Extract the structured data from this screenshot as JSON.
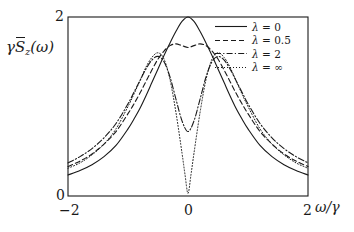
{
  "chart_data": {
    "type": "line",
    "title": "",
    "xlabel": "ω/γ",
    "ylabel": "γS̃_z(ω)",
    "xlim": [
      -2,
      2
    ],
    "ylim": [
      0,
      2
    ],
    "xticks": [
      "-2",
      "0",
      "2"
    ],
    "xtick_values": [
      -2,
      0,
      2
    ],
    "yticks": [
      "0",
      "2"
    ],
    "ytick_values": [
      0,
      2
    ],
    "grid": false,
    "legend_position": "top-right",
    "series": [
      {
        "name": "λ = 0",
        "linestyle": "solid",
        "color": "#1a1a1a",
        "peak_value": 2.0,
        "center_value": 2.0,
        "x": [
          -2,
          -1.8,
          -1.6,
          -1.4,
          -1.2,
          -1,
          -0.9,
          -0.8,
          -0.7,
          -0.6,
          -0.5,
          -0.4,
          -0.3,
          -0.2,
          -0.1,
          0,
          0.1,
          0.2,
          0.3,
          0.4,
          0.5,
          0.6,
          0.7,
          0.8,
          0.9,
          1,
          1.2,
          1.4,
          1.6,
          1.8,
          2
        ],
        "values": [
          0.235,
          0.285,
          0.35,
          0.44,
          0.565,
          0.75,
          0.86,
          0.98,
          1.12,
          1.27,
          1.42,
          1.57,
          1.71,
          1.84,
          1.95,
          2.0,
          1.95,
          1.84,
          1.71,
          1.57,
          1.42,
          1.27,
          1.12,
          0.98,
          0.86,
          0.75,
          0.565,
          0.44,
          0.35,
          0.285,
          0.235
        ]
      },
      {
        "name": "λ = 0.5",
        "linestyle": "dashed",
        "color": "#1a1a1a",
        "peak_value": 1.7,
        "center_value": 1.66,
        "x": [
          -2,
          -1.8,
          -1.6,
          -1.4,
          -1.2,
          -1,
          -0.9,
          -0.8,
          -0.7,
          -0.6,
          -0.5,
          -0.4,
          -0.3,
          -0.2,
          -0.1,
          0,
          0.1,
          0.2,
          0.3,
          0.4,
          0.5,
          0.6,
          0.7,
          0.8,
          0.9,
          1,
          1.2,
          1.4,
          1.6,
          1.8,
          2
        ],
        "values": [
          0.33,
          0.39,
          0.47,
          0.58,
          0.72,
          0.92,
          1.03,
          1.15,
          1.28,
          1.41,
          1.53,
          1.62,
          1.68,
          1.7,
          1.68,
          1.66,
          1.68,
          1.7,
          1.68,
          1.62,
          1.53,
          1.41,
          1.28,
          1.15,
          1.03,
          0.92,
          0.72,
          0.58,
          0.47,
          0.39,
          0.33
        ]
      },
      {
        "name": "λ = 2",
        "linestyle": "dashdot",
        "color": "#1a1a1a",
        "peak_value": 1.56,
        "center_value": 0.72,
        "x": [
          -2,
          -1.8,
          -1.6,
          -1.4,
          -1.2,
          -1,
          -0.9,
          -0.8,
          -0.7,
          -0.6,
          -0.5,
          -0.4,
          -0.3,
          -0.2,
          -0.1,
          0,
          0.1,
          0.2,
          0.3,
          0.4,
          0.5,
          0.6,
          0.7,
          0.8,
          0.9,
          1,
          1.2,
          1.4,
          1.6,
          1.8,
          2
        ],
        "values": [
          0.37,
          0.44,
          0.53,
          0.65,
          0.81,
          1.03,
          1.16,
          1.29,
          1.42,
          1.52,
          1.56,
          1.5,
          1.33,
          1.08,
          0.84,
          0.72,
          0.84,
          1.08,
          1.33,
          1.5,
          1.56,
          1.52,
          1.42,
          1.29,
          1.16,
          1.03,
          0.81,
          0.65,
          0.53,
          0.44,
          0.37
        ]
      },
      {
        "name": "λ = ∞",
        "linestyle": "dotted",
        "color": "#1a1a1a",
        "peak_value": 1.6,
        "center_value": 0.03,
        "x": [
          -2,
          -1.8,
          -1.6,
          -1.4,
          -1.2,
          -1,
          -0.9,
          -0.8,
          -0.7,
          -0.6,
          -0.5,
          -0.4,
          -0.3,
          -0.2,
          -0.1,
          -0.05,
          0,
          0.05,
          0.1,
          0.2,
          0.3,
          0.4,
          0.5,
          0.6,
          0.7,
          0.8,
          0.9,
          1,
          1.2,
          1.4,
          1.6,
          1.8,
          2
        ],
        "values": [
          0.31,
          0.37,
          0.46,
          0.58,
          0.75,
          1.0,
          1.14,
          1.29,
          1.44,
          1.55,
          1.6,
          1.53,
          1.3,
          0.93,
          0.48,
          0.24,
          0.03,
          0.24,
          0.48,
          0.93,
          1.3,
          1.53,
          1.6,
          1.55,
          1.44,
          1.29,
          1.14,
          1.0,
          0.75,
          0.58,
          0.46,
          0.37,
          0.31
        ]
      }
    ]
  },
  "axes": {
    "ylabel_gamma": "γ",
    "ylabel_s": "S",
    "ylabel_sub": "z",
    "ylabel_arg": "(ω)",
    "xlabel_text": "ω/γ",
    "ytick_top": "2",
    "ytick_bottom": "0",
    "xtick_left": "−2",
    "xtick_mid": "0",
    "xtick_right": "2"
  },
  "legend": {
    "entries": [
      {
        "label_lambda": "λ",
        "label_eq": "= 0",
        "style": "solid"
      },
      {
        "label_lambda": "λ",
        "label_eq": "= 0.5",
        "style": "dashed"
      },
      {
        "label_lambda": "λ",
        "label_eq": "= 2",
        "style": "dashdot"
      },
      {
        "label_lambda": "λ",
        "label_eq": "= ∞",
        "style": "dotted"
      }
    ]
  }
}
